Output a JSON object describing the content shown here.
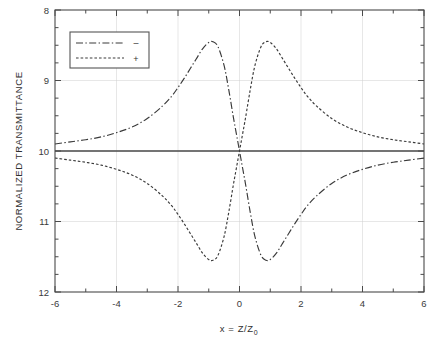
{
  "figure": {
    "name": "z-scan-normalized-transmittance-plot"
  },
  "axes": {
    "x_title_main": "x = Z/Z",
    "x_title_sub": "0",
    "y_title": "NORMALIZED TRANSMITTANCE",
    "x_ticks": [
      "-6",
      "-4",
      "-2",
      "0",
      "2",
      "4",
      "6"
    ],
    "y_ticks": [
      "12",
      "11",
      "10",
      "9",
      "8"
    ]
  },
  "legend": {
    "entries": [
      {
        "symbol": "–",
        "style": "dash-dot"
      },
      {
        "symbol": "+",
        "style": "dotted"
      }
    ]
  },
  "chart_data": {
    "type": "line",
    "title": "",
    "xlabel": "x = Z/Z0",
    "ylabel": "NORMALIZED TRANSMITTANCE",
    "xlim": [
      -6,
      6
    ],
    "ylim": [
      8,
      12
    ],
    "xticks": [
      -6,
      -4,
      -2,
      0,
      2,
      4,
      6
    ],
    "yticks": [
      8,
      9,
      10,
      11,
      12
    ],
    "xminorticks": [
      -5,
      -3,
      -1,
      1,
      3,
      5
    ],
    "yminorticks": [
      8.25,
      8.5,
      8.75,
      9.25,
      9.5,
      9.75,
      10.25,
      10.5,
      10.75,
      11.25,
      11.5,
      11.75
    ],
    "grid": true,
    "grid_axes": "both",
    "legend_position": "upper-left-inside",
    "baseline": {
      "label": "reference",
      "value": 10,
      "style": "solid"
    },
    "series": [
      {
        "name": "negative-nonlinearity",
        "legend_symbol": "–",
        "style": "dash-dot",
        "peak": {
          "x": -0.86,
          "y": 11.55
        },
        "valley": {
          "x": 0.86,
          "y": 8.45
        },
        "x": [
          -6.0,
          -5.5,
          -5.0,
          -4.5,
          -4.0,
          -3.5,
          -3.0,
          -2.5,
          -2.2,
          -2.0,
          -1.8,
          -1.6,
          -1.4,
          -1.2,
          -1.0,
          -0.86,
          -0.7,
          -0.5,
          -0.35,
          -0.2,
          -0.1,
          0.0,
          0.1,
          0.2,
          0.35,
          0.5,
          0.7,
          0.86,
          1.0,
          1.2,
          1.4,
          1.6,
          1.8,
          2.0,
          2.2,
          2.5,
          3.0,
          3.5,
          4.0,
          4.5,
          5.0,
          5.5,
          6.0
        ],
        "y": [
          10.1,
          10.13,
          10.16,
          10.2,
          10.26,
          10.34,
          10.46,
          10.64,
          10.78,
          10.9,
          11.03,
          11.17,
          11.31,
          11.45,
          11.54,
          11.55,
          11.48,
          11.21,
          10.87,
          10.48,
          10.24,
          10.0,
          9.76,
          9.52,
          9.13,
          8.79,
          8.52,
          8.45,
          8.46,
          8.55,
          8.69,
          8.83,
          8.97,
          9.1,
          9.22,
          9.36,
          9.54,
          9.66,
          9.74,
          9.8,
          9.84,
          9.87,
          9.9
        ]
      },
      {
        "name": "positive-nonlinearity",
        "legend_symbol": "+",
        "style": "dotted",
        "peak": {
          "x": 0.86,
          "y": 11.55
        },
        "valley": {
          "x": -0.86,
          "y": 8.45
        },
        "x": [
          -6.0,
          -5.5,
          -5.0,
          -4.5,
          -4.0,
          -3.5,
          -3.0,
          -2.5,
          -2.2,
          -2.0,
          -1.8,
          -1.6,
          -1.4,
          -1.2,
          -1.0,
          -0.86,
          -0.7,
          -0.5,
          -0.35,
          -0.2,
          -0.1,
          0.0,
          0.1,
          0.2,
          0.35,
          0.5,
          0.7,
          0.86,
          1.0,
          1.2,
          1.4,
          1.6,
          1.8,
          2.0,
          2.2,
          2.5,
          3.0,
          3.5,
          4.0,
          4.5,
          5.0,
          5.5,
          6.0
        ],
        "y": [
          9.9,
          9.87,
          9.84,
          9.8,
          9.74,
          9.66,
          9.54,
          9.36,
          9.22,
          9.1,
          8.97,
          8.83,
          8.69,
          8.55,
          8.46,
          8.45,
          8.52,
          8.79,
          9.13,
          9.52,
          9.76,
          10.0,
          10.24,
          10.48,
          10.87,
          11.21,
          11.48,
          11.55,
          11.54,
          11.45,
          11.31,
          11.17,
          11.03,
          10.9,
          10.78,
          10.64,
          10.46,
          10.34,
          10.26,
          10.2,
          10.16,
          10.13,
          10.1
        ]
      }
    ]
  }
}
